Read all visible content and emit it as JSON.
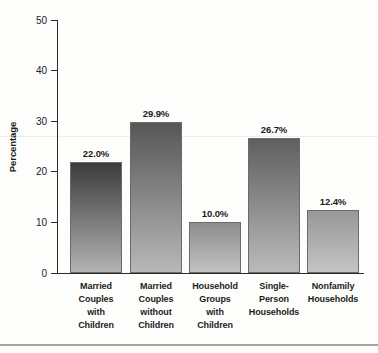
{
  "chart_data": {
    "type": "bar",
    "title": "",
    "ylabel": "Percentage",
    "xlabel": "",
    "ylim": [
      0,
      50
    ],
    "yticks": [
      0,
      10,
      20,
      30,
      40,
      50
    ],
    "grid": false,
    "legend": false,
    "categories": [
      "Married\nCouples\nwith\nChildren",
      "Married\nCouples\nwithout\nChildren",
      "Household\nGroups\nwith\nChildren",
      "Single-\nPerson\nHouseholds",
      "Nonfamily\nHouseholds"
    ],
    "values": [
      22.0,
      29.9,
      10.0,
      26.7,
      12.4
    ],
    "value_labels": [
      "22.0%",
      "29.9%",
      "10.0%",
      "26.7%",
      "12.4%"
    ],
    "axis_color": "#2a2a2a",
    "bar_border_color": "#6a6a6a",
    "bar_styles": [
      {
        "top": "#3b3b3b",
        "bottom": "#b3b3b3"
      },
      {
        "top": "#565656",
        "bottom": "#b8b8b8"
      },
      {
        "top": "#8d8d8d",
        "bottom": "#c2c2c2"
      },
      {
        "top": "#5f5f5f",
        "bottom": "#bababa"
      },
      {
        "top": "#989898",
        "bottom": "#c4c4c4"
      }
    ]
  }
}
